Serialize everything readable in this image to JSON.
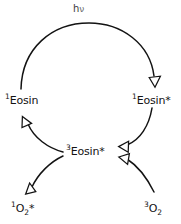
{
  "diagram": {
    "type": "reaction-scheme",
    "background_color": "#ffffff",
    "stroke_color": "#131313",
    "arrowhead_style": "open-triangle",
    "photon_label": {
      "symbol": "h",
      "greek": "ν",
      "full": "hν"
    },
    "species": [
      {
        "id": "singlet-eosin-ground",
        "superscript": "1",
        "body": "Eosin",
        "star": "",
        "subscript": "",
        "full": "¹Eosin",
        "x": 5,
        "y": 95
      },
      {
        "id": "singlet-eosin-excited",
        "superscript": "1",
        "body": "Eosin",
        "star": "*",
        "subscript": "",
        "full": "¹Eosin*",
        "x": 132,
        "y": 95
      },
      {
        "id": "triplet-eosin-excited",
        "superscript": "3",
        "body": "Eosin",
        "star": "*",
        "subscript": "",
        "full": "³Eosin*",
        "x": 66,
        "y": 146
      },
      {
        "id": "singlet-oxygen",
        "superscript": "1",
        "body": "O",
        "subscript": "2",
        "star": "*",
        "full": "¹O₂*",
        "x": 11,
        "y": 203
      },
      {
        "id": "triplet-oxygen",
        "superscript": "3",
        "body": "O",
        "subscript": "2",
        "star": "",
        "full": "³O₂",
        "x": 144,
        "y": 203
      }
    ],
    "arrows": [
      {
        "id": "excitation-arc",
        "from": "singlet-eosin-ground",
        "to": "singlet-eosin-excited",
        "label": "hν",
        "direction": "clockwise-over-top"
      },
      {
        "id": "intersystem-crossing-arc",
        "from": "singlet-eosin-excited",
        "to": "triplet-eosin-excited",
        "label": "",
        "direction": "down-left"
      },
      {
        "id": "triplet-to-ground-arc",
        "from": "triplet-eosin-excited",
        "to": "singlet-eosin-ground",
        "label": "",
        "direction": "up-left"
      },
      {
        "id": "singlet-oxygen-production-arc",
        "from": "triplet-eosin-excited",
        "to": "singlet-oxygen",
        "label": "",
        "direction": "down-left"
      },
      {
        "id": "oxygen-quenching-arc",
        "from": "triplet-oxygen",
        "to": "triplet-eosin-excited",
        "label": "",
        "direction": "up-left"
      }
    ]
  }
}
